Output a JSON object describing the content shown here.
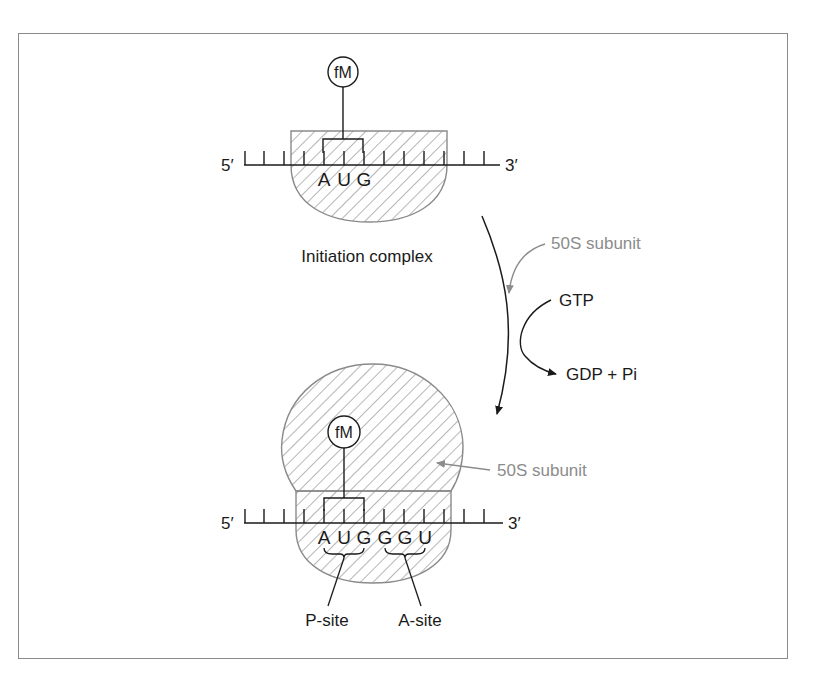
{
  "figure": {
    "colors": {
      "ink": "#1a1a1a",
      "grey_label": "#8c8c8c",
      "frame": "#8a8a8a",
      "hatch": "#6e6e6e"
    }
  },
  "top_complex": {
    "label": "Initiation complex",
    "tRNA_label": "fM",
    "five_prime": "5′",
    "three_prime": "3′",
    "codon_bases": [
      "A",
      "U",
      "G"
    ]
  },
  "transition": {
    "subunit_label": "50S subunit",
    "gtp_label": "GTP",
    "products_label": "GDP + Pi"
  },
  "bottom_complex": {
    "tRNA_label": "fM",
    "subunit_label": "50S subunit",
    "five_prime": "5′",
    "three_prime": "3′",
    "codon_bases": [
      "A",
      "U",
      "G",
      "G",
      "G",
      "U"
    ],
    "p_site_label": "P-site",
    "a_site_label": "A-site"
  }
}
